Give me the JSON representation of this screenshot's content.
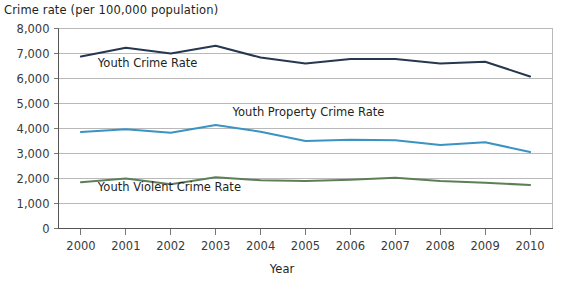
{
  "chart_data": {
    "type": "line",
    "title": "",
    "ylabel": "Crime rate (per 100,000 population)",
    "xlabel": "Year",
    "categories": [
      "2000",
      "2001",
      "2002",
      "2003",
      "2004",
      "2005",
      "2006",
      "2007",
      "2008",
      "2009",
      "2010"
    ],
    "x": [
      2000,
      2001,
      2002,
      2003,
      2004,
      2005,
      2006,
      2007,
      2008,
      2009,
      2010
    ],
    "ylim": [
      0,
      8000
    ],
    "ytick_labels": [
      "8,000",
      "7,000",
      "6,000",
      "5,000",
      "4,000",
      "3,000",
      "2,000",
      "1,000",
      "0"
    ],
    "ytick_values": [
      8000,
      7000,
      6000,
      5000,
      4000,
      3000,
      2000,
      1000,
      0
    ],
    "grid": true,
    "legend_position": "inline-labels",
    "series": [
      {
        "name": "Youth Crime Rate",
        "color": "#27374f",
        "values": [
          6880,
          7230,
          7000,
          7310,
          6840,
          6600,
          6780,
          6780,
          6600,
          6670,
          6080
        ],
        "label_x": 2001,
        "label_y": 6450
      },
      {
        "name": "Youth Property Crime Rate",
        "color": "#3b93c4",
        "values": [
          3860,
          3970,
          3830,
          4140,
          3870,
          3500,
          3550,
          3530,
          3340,
          3450,
          3060
        ],
        "label_x": 2004,
        "label_y": 4520
      },
      {
        "name": "Youth Violent Crime Rate",
        "color": "#5d7f56",
        "values": [
          1850,
          2000,
          1770,
          2050,
          1930,
          1900,
          1950,
          2030,
          1900,
          1830,
          1740
        ],
        "label_x": 2001,
        "label_y": 1500
      }
    ]
  },
  "colors": {
    "youth_crime_rate": "#27374f",
    "youth_property_crime_rate": "#3b93c4",
    "youth_violent_crime_rate": "#5d7f56",
    "gridline": "#b9b9b9",
    "axis": "#555555",
    "background": "#ffffff"
  }
}
